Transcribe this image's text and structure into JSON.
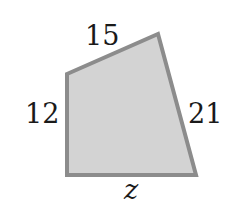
{
  "diagram": {
    "shape": "quadrilateral",
    "colors": {
      "fill": "#d3d3d3",
      "stroke": "#8c8c8c",
      "text": "#1a1a1a"
    },
    "vertices": [
      {
        "x": 67,
        "y": 74
      },
      {
        "x": 158,
        "y": 34
      },
      {
        "x": 196,
        "y": 175
      },
      {
        "x": 67,
        "y": 175
      }
    ],
    "side_labels": {
      "top": "15",
      "left": "12",
      "right": "21",
      "bottom": "z"
    }
  }
}
